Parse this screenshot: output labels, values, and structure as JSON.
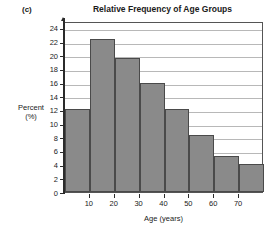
{
  "figure": {
    "panel_label": "(c)",
    "title": "Relative Frequency of Age Groups"
  },
  "axes": {
    "ylabel_line1": "Percent",
    "ylabel_line2": "(%)",
    "xlabel": "Age (years)",
    "ytick_labels": [
      "0",
      "2",
      "4",
      "6",
      "8",
      "10",
      "12",
      "14",
      "16",
      "18",
      "20",
      "22",
      "24"
    ],
    "xtick_labels": [
      "10",
      "20",
      "30",
      "40",
      "50",
      "60",
      "70"
    ]
  },
  "style": {
    "bar_fill": "#8a8a8a",
    "bar_stroke": "#4a4a4a",
    "gridline_color": "#b8b8b8",
    "axis_color": "#2b2b2b",
    "frame_color": "#555555",
    "background": "#ffffff"
  },
  "chart_data": {
    "type": "bar",
    "title": "Relative Frequency of Age Groups",
    "xlabel": "Age (years)",
    "ylabel": "Percent (%)",
    "categories": [
      "0-10",
      "10-20",
      "20-30",
      "30-40",
      "40-50",
      "50-60",
      "60-70",
      "70-80"
    ],
    "bin_edges": [
      0,
      10,
      20,
      30,
      40,
      50,
      60,
      70,
      80
    ],
    "values": [
      12.2,
      22.4,
      19.6,
      15.9,
      12.2,
      8.4,
      5.2,
      4.1
    ],
    "ylim": [
      0,
      25
    ],
    "xlim": [
      0,
      80
    ],
    "ytick_values": [
      0,
      2,
      4,
      6,
      8,
      10,
      12,
      14,
      16,
      18,
      20,
      22,
      24
    ],
    "xtick_values": [
      10,
      20,
      30,
      40,
      50,
      60,
      70
    ],
    "grid": "horizontal",
    "legend": "none"
  }
}
